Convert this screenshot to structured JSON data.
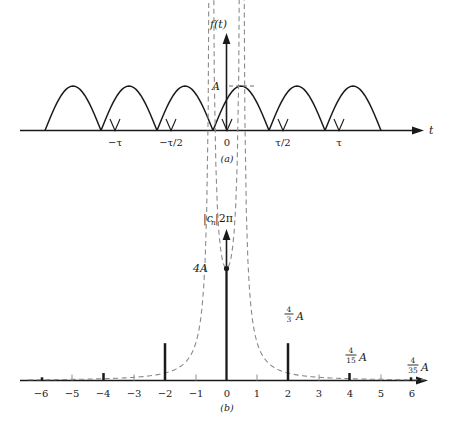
{
  "figure": {
    "panels": [
      {
        "caption": "(a)",
        "y_axis_label": "f(t)",
        "x_axis_label": "t",
        "amplitude_label": "A",
        "x_ticks": [
          "−τ",
          "−τ/2",
          "0",
          "τ/2",
          "τ"
        ]
      },
      {
        "caption": "(b)",
        "y_axis_label_base": "|c",
        "y_axis_label_sub": "n",
        "y_axis_label_tail": "|2π",
        "peak_label": "4A",
        "x_ticks": [
          "−6",
          "−5",
          "−4",
          "−3",
          "−2",
          "−1",
          "0",
          "1",
          "2",
          "3",
          "4",
          "5",
          "6"
        ],
        "line_labels": [
          {
            "n": 2,
            "num": "4",
            "den": "3",
            "suffix": "A"
          },
          {
            "n": 4,
            "num": "4",
            "den": "15",
            "suffix": "A"
          },
          {
            "n": 6,
            "num": "4",
            "den": "35",
            "suffix": "A"
          }
        ]
      }
    ]
  },
  "chart_data": [
    {
      "type": "line",
      "title": "(a) Full-wave rectified sine wave",
      "xlabel": "t",
      "ylabel": "f(t)",
      "xlim": [
        -1.75,
        1.75
      ],
      "ylim": [
        0,
        1.35
      ],
      "x_tick_values": [
        -1,
        -0.5,
        0,
        0.5,
        1
      ],
      "x_tick_labels": [
        "−τ",
        "−τ/2",
        "0",
        "τ/2",
        "τ"
      ],
      "y_tick_values": [
        1
      ],
      "y_tick_labels": [
        "A"
      ],
      "grid": false,
      "legend": false,
      "description": "f(t) = A |sin(2πt/τ)| : six rectified half-sine arches of peak amplitude A, period τ/2, zeros at multiples of τ/4.",
      "arch_peak": 1.0,
      "arch_half_width": 0.25,
      "arch_centers": [
        -1.375,
        -0.875,
        -0.375,
        0.125,
        0.625,
        1.125
      ],
      "zero_crossings": [
        -1.625,
        -1.125,
        -0.625,
        -0.125,
        0.375,
        0.875,
        1.375
      ]
    },
    {
      "type": "bar",
      "title": "(b) Magnitude line spectrum",
      "xlabel": "n",
      "ylabel": "|c_n|2π",
      "xlim": [
        -6.6,
        6.6
      ],
      "ylim": [
        0,
        4.45
      ],
      "grid": false,
      "legend": false,
      "categories": [
        -6,
        -5,
        -4,
        -3,
        -2,
        -1,
        0,
        1,
        2,
        3,
        4,
        5,
        6
      ],
      "values": [
        0.1143,
        0,
        0.2667,
        0,
        1.3333,
        0,
        4.0,
        0,
        1.3333,
        0,
        0.2667,
        0,
        0.1143
      ],
      "value_labels": [
        "4/35 A",
        "",
        "4/15 A",
        "",
        "4/3 A",
        "",
        "4A",
        "",
        "4/3 A",
        "",
        "4/15 A",
        "",
        "4/35 A"
      ],
      "envelope": {
        "style": "dashed",
        "description": "Envelope 4A/(1-4n^2) magnitude through the spectral line tips"
      },
      "peak_marker": {
        "x": 0,
        "y": 4.0,
        "shape": "dot"
      }
    }
  ]
}
